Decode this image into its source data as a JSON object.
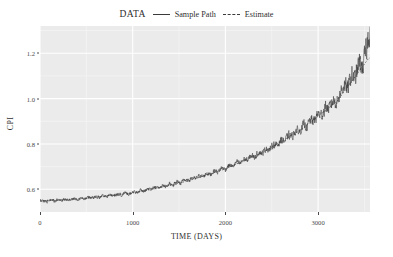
{
  "legend": {
    "title": "DATA",
    "entries": [
      {
        "label": "Sample Path",
        "style": "solid",
        "color": "#3a3a3a"
      },
      {
        "label": "Estimate",
        "style": "dotted",
        "color": "#3a3a3a"
      }
    ]
  },
  "axes": {
    "x_label": "TIME (DAYS)",
    "y_label": "CPI",
    "x_ticks": [
      "0",
      "1000",
      "2000",
      "3000"
    ],
    "y_ticks": [
      "0.6",
      "0.8",
      "1.0",
      "1.2"
    ]
  },
  "colors": {
    "panel_background": "#ebebeb",
    "grid_major": "#ffffff",
    "grid_minor": "#f5f5f5",
    "line": "#3a3a3a",
    "text": "#2f2f2f",
    "tick_text": "#4a4a4a"
  },
  "chart_data": {
    "type": "line",
    "title": "",
    "xlabel": "TIME (DAYS)",
    "ylabel": "CPI",
    "xlim": [
      0,
      3560
    ],
    "ylim": [
      0.5,
      1.32
    ],
    "x_ticks": [
      0,
      1000,
      2000,
      3000
    ],
    "y_ticks": [
      0.6,
      0.8,
      1.0,
      1.2
    ],
    "grid": true,
    "legend_position": "top-center",
    "legend_title": "DATA",
    "series": [
      {
        "name": "Sample Path",
        "style": "solid",
        "description": "Daily noisy CPI sample path, flat near 0.55 until about day 700, then a steady upward drift with volatility growing with level, ending near 1.30 at day 3550.",
        "x": [
          0,
          40,
          80,
          120,
          160,
          200,
          240,
          280,
          320,
          360,
          400,
          440,
          480,
          520,
          560,
          600,
          640,
          680,
          720,
          760,
          800,
          840,
          880,
          920,
          960,
          1000,
          1040,
          1080,
          1120,
          1160,
          1200,
          1240,
          1280,
          1320,
          1360,
          1400,
          1440,
          1480,
          1520,
          1560,
          1600,
          1640,
          1680,
          1720,
          1760,
          1800,
          1840,
          1880,
          1920,
          1960,
          2000,
          2040,
          2080,
          2120,
          2160,
          2200,
          2240,
          2280,
          2320,
          2360,
          2400,
          2440,
          2480,
          2520,
          2560,
          2600,
          2640,
          2680,
          2720,
          2760,
          2800,
          2840,
          2880,
          2920,
          2960,
          3000,
          3040,
          3080,
          3120,
          3160,
          3200,
          3240,
          3280,
          3320,
          3360,
          3400,
          3440,
          3480,
          3520,
          3550
        ],
        "y": [
          0.548,
          0.551,
          0.546,
          0.553,
          0.549,
          0.556,
          0.551,
          0.558,
          0.553,
          0.561,
          0.556,
          0.563,
          0.558,
          0.566,
          0.561,
          0.569,
          0.564,
          0.572,
          0.567,
          0.576,
          0.571,
          0.58,
          0.575,
          0.585,
          0.579,
          0.59,
          0.584,
          0.596,
          0.59,
          0.603,
          0.597,
          0.61,
          0.604,
          0.618,
          0.611,
          0.626,
          0.619,
          0.634,
          0.627,
          0.643,
          0.636,
          0.652,
          0.645,
          0.662,
          0.655,
          0.672,
          0.665,
          0.683,
          0.676,
          0.695,
          0.688,
          0.707,
          0.7,
          0.72,
          0.713,
          0.734,
          0.727,
          0.749,
          0.742,
          0.765,
          0.758,
          0.782,
          0.775,
          0.8,
          0.793,
          0.819,
          0.812,
          0.839,
          0.832,
          0.861,
          0.854,
          0.884,
          0.877,
          0.908,
          0.901,
          0.934,
          0.927,
          0.962,
          0.955,
          0.992,
          0.985,
          1.024,
          1.06,
          1.045,
          1.105,
          1.085,
          1.16,
          1.135,
          1.215,
          1.3
        ]
      },
      {
        "name": "Estimate",
        "style": "dotted",
        "description": "Smoothed estimate overlaying the sample path (nearly coincident, drawn dotted).",
        "x": [
          0,
          400,
          800,
          1200,
          1600,
          2000,
          2400,
          2800,
          3200,
          3550
        ],
        "y": [
          0.549,
          0.558,
          0.574,
          0.599,
          0.637,
          0.69,
          0.762,
          0.858,
          0.986,
          1.18
        ]
      }
    ]
  }
}
